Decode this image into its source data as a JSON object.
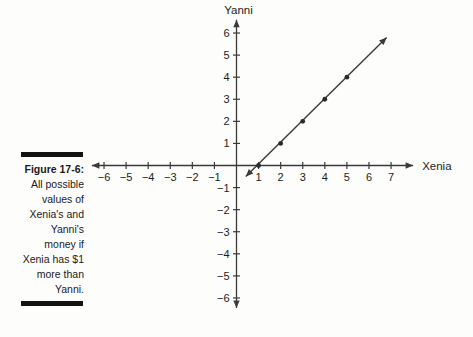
{
  "figure": {
    "label": "Figure 17-6:",
    "caption_lines": [
      "All possible",
      "values of",
      "Xenia's and",
      "Yanni's",
      "money if",
      "Xenia has $1",
      "more than",
      "Yanni."
    ]
  },
  "chart_data": {
    "type": "line",
    "title": "",
    "xlabel": "Xenia",
    "ylabel": "Yanni",
    "x_ticks": [
      -6,
      -5,
      -4,
      -3,
      -2,
      -1,
      1,
      2,
      3,
      4,
      5,
      6,
      7
    ],
    "y_ticks": [
      -6,
      -5,
      -4,
      -3,
      -2,
      -1,
      1,
      2,
      3,
      4,
      5,
      6
    ],
    "xlim": [
      -6.55,
      8.0
    ],
    "ylim": [
      -6.45,
      6.6
    ],
    "grid": false,
    "legend": false,
    "series": [
      {
        "points": [
          [
            1,
            0
          ],
          [
            2,
            1
          ],
          [
            3,
            2
          ],
          [
            4,
            3
          ],
          [
            5,
            4
          ]
        ],
        "segment": {
          "from": [
            0.42,
            -0.5
          ],
          "to": [
            6.8,
            5.8
          ],
          "arrow_both_ends": true
        }
      }
    ],
    "colors": {
      "ink": "#3a3a3a",
      "text": "#1c1c1c",
      "point": "#2a2a2a"
    }
  }
}
